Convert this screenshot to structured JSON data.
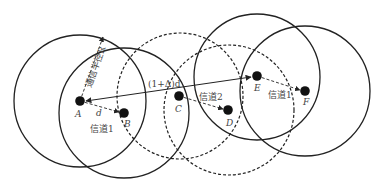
{
  "figure": {
    "top_text": "",
    "caption": "",
    "stroke_color": "#222222",
    "nodes": [
      {
        "id": "A",
        "label": "A",
        "circle": "solid"
      },
      {
        "id": "B",
        "label": "B",
        "circle": "solid"
      },
      {
        "id": "C",
        "label": "C",
        "circle": "dashed"
      },
      {
        "id": "D",
        "label": "D",
        "circle": "dashed"
      },
      {
        "id": "E",
        "label": "E",
        "circle": "solid"
      },
      {
        "id": "F",
        "label": "F",
        "circle": "solid"
      }
    ],
    "labels": {
      "radius": "通信半径R",
      "distance": "d",
      "long_hop": "(1+Δ)d",
      "channel_ab": "信道1",
      "channel_cd": "信道2",
      "channel_ef": "信道1"
    },
    "links": [
      {
        "from": "A",
        "to": "B",
        "style": "dashed",
        "label": "channel_ab"
      },
      {
        "from": "C",
        "to": "D",
        "style": "dashed",
        "label": "channel_cd"
      },
      {
        "from": "E",
        "to": "F",
        "style": "dashed",
        "label": "channel_ef"
      },
      {
        "from": "E",
        "to": "A",
        "style": "solid",
        "label": "long_hop"
      }
    ]
  }
}
